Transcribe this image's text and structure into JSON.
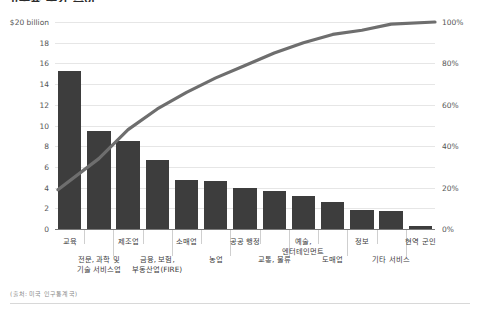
{
  "title": "고용률 증가 추이",
  "source_note": "(출처: 미국 인구통계국)",
  "axis": {
    "y_left_top_label": "$20 billion",
    "y_left_ticks": [
      "$20 billion",
      "18",
      "16",
      "14",
      "12",
      "10",
      "8",
      "6",
      "4",
      "2",
      "0"
    ],
    "y_right_ticks": [
      "100%",
      "80%",
      "60%",
      "40%",
      "20%",
      "0%"
    ]
  },
  "colors": {
    "bar": "#3d3d3d",
    "line": "#6e6e6e",
    "grid": "#e6e6e6",
    "baseline": "#7a7a7a",
    "text": "#3b3b3b",
    "muted": "#8a8a8a"
  },
  "chart_data": {
    "type": "bar",
    "title": "고용률 증가 추이",
    "xlabel": "",
    "ylabel": "$20 billion",
    "ylim": [
      0,
      20
    ],
    "y2lim": [
      0,
      100
    ],
    "y2label": "누적 비율",
    "grid": true,
    "legend": "none",
    "categories": [
      "교육",
      "전문, 과학 및 기술 서비스업",
      "제조업",
      "금융, 보험, 부동산업(FIRE)",
      "소매업",
      "농업",
      "공공 행정",
      "교통, 물류",
      "예술, 엔터테인먼트",
      "도매업",
      "정보",
      "기타 서비스",
      "현역 군인"
    ],
    "series": [
      {
        "name": "금액 (10억 달러)",
        "type": "bar",
        "values": [
          15.3,
          9.5,
          8.5,
          6.7,
          4.7,
          4.6,
          4.0,
          3.7,
          3.2,
          2.6,
          1.8,
          1.7,
          0.3
        ]
      },
      {
        "name": "누적 비율",
        "type": "line",
        "axis": "right",
        "values": [
          19,
          34,
          48,
          58,
          66,
          73,
          79,
          85,
          90,
          94,
          96,
          99,
          100
        ]
      }
    ]
  },
  "labels_row1": [
    {
      "text": "교육",
      "index": 0
    },
    {
      "text": "제조업",
      "index": 2
    },
    {
      "text": "소매업",
      "index": 4
    },
    {
      "text": "공공 행정",
      "index": 6
    },
    {
      "text": "예술,\n엔터테인먼트",
      "index": 8
    },
    {
      "text": "정보",
      "index": 10
    },
    {
      "text": "현역 군인",
      "index": 12
    }
  ],
  "labels_row2": [
    {
      "text": "전문, 과학 및\n기술 서비스업",
      "index": 1
    },
    {
      "text": "금융, 보험,\n부동산업(FIRE)",
      "index": 3
    },
    {
      "text": "농업",
      "index": 5
    },
    {
      "text": "교통, 물류",
      "index": 7
    },
    {
      "text": "도매업",
      "index": 9
    },
    {
      "text": "기타 서비스",
      "index": 11
    }
  ]
}
